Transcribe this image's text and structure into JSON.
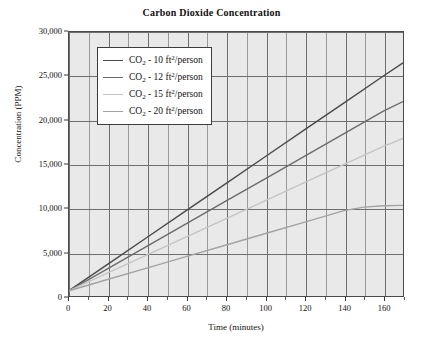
{
  "chart_data": {
    "type": "line",
    "title": "Carbon Dioxide Concentration",
    "xlabel": "Time (minutes)",
    "ylabel": "Concentration (PPM)",
    "xlim": [
      0,
      170
    ],
    "ylim": [
      0,
      30000
    ],
    "xticks": [
      0,
      20,
      40,
      60,
      80,
      100,
      120,
      140,
      160
    ],
    "xtick_labels": [
      "0",
      "20",
      "40",
      "60",
      "80",
      "100",
      "120",
      "140",
      "160"
    ],
    "xminor_step": 10,
    "yticks": [
      0,
      5000,
      10000,
      15000,
      20000,
      25000,
      30000
    ],
    "ytick_labels": [
      "0",
      "5,000",
      "10,000",
      "15,000",
      "20,000",
      "25,000",
      "30,000"
    ],
    "grid": true,
    "legend_position": "upper-left",
    "series": [
      {
        "name": "CO2 - 10 ft2/person",
        "label_prefix": "CO",
        "label_sub": "2",
        "label_mid": " - 10  ft",
        "label_sup": "2",
        "label_suffix": "/person",
        "color": "#4a4a4a",
        "x": [
          0,
          20,
          40,
          60,
          80,
          100,
          120,
          140,
          160,
          170
        ],
        "values": [
          600,
          3650,
          6700,
          9750,
          12800,
          15850,
          18900,
          21950,
          25000,
          26500
        ]
      },
      {
        "name": "CO2 - 12 ft2/person",
        "label_prefix": "CO",
        "label_sub": "2",
        "label_mid": " - 12  ft",
        "label_sup": "2",
        "label_suffix": "/person",
        "color": "#6b6b6b",
        "x": [
          0,
          20,
          40,
          60,
          80,
          100,
          120,
          140,
          160,
          170
        ],
        "values": [
          600,
          3150,
          5700,
          8250,
          10800,
          13350,
          15900,
          18450,
          21000,
          22100
        ]
      },
      {
        "name": "CO2 - 15 ft2/person",
        "label_prefix": "CO",
        "label_sub": "2",
        "label_mid": " - 15  ft",
        "label_sup": "2",
        "label_suffix": "/person",
        "color": "#c4c4c4",
        "x": [
          0,
          20,
          40,
          60,
          80,
          100,
          120,
          140,
          160,
          170
        ],
        "values": [
          600,
          2650,
          4700,
          6750,
          8800,
          10850,
          12900,
          14950,
          17000,
          17900
        ]
      },
      {
        "name": "CO2 - 20 ft2/person",
        "label_prefix": "CO",
        "label_sub": "2",
        "label_mid": " - 20  ft",
        "label_sup": "2",
        "label_suffix": "/person",
        "color": "#a3a3a3",
        "x": [
          0,
          20,
          40,
          60,
          80,
          100,
          120,
          130,
          140,
          150,
          160,
          170
        ],
        "values": [
          600,
          1900,
          3200,
          4500,
          5800,
          7100,
          8400,
          9050,
          9700,
          10100,
          10250,
          10300
        ]
      }
    ]
  }
}
